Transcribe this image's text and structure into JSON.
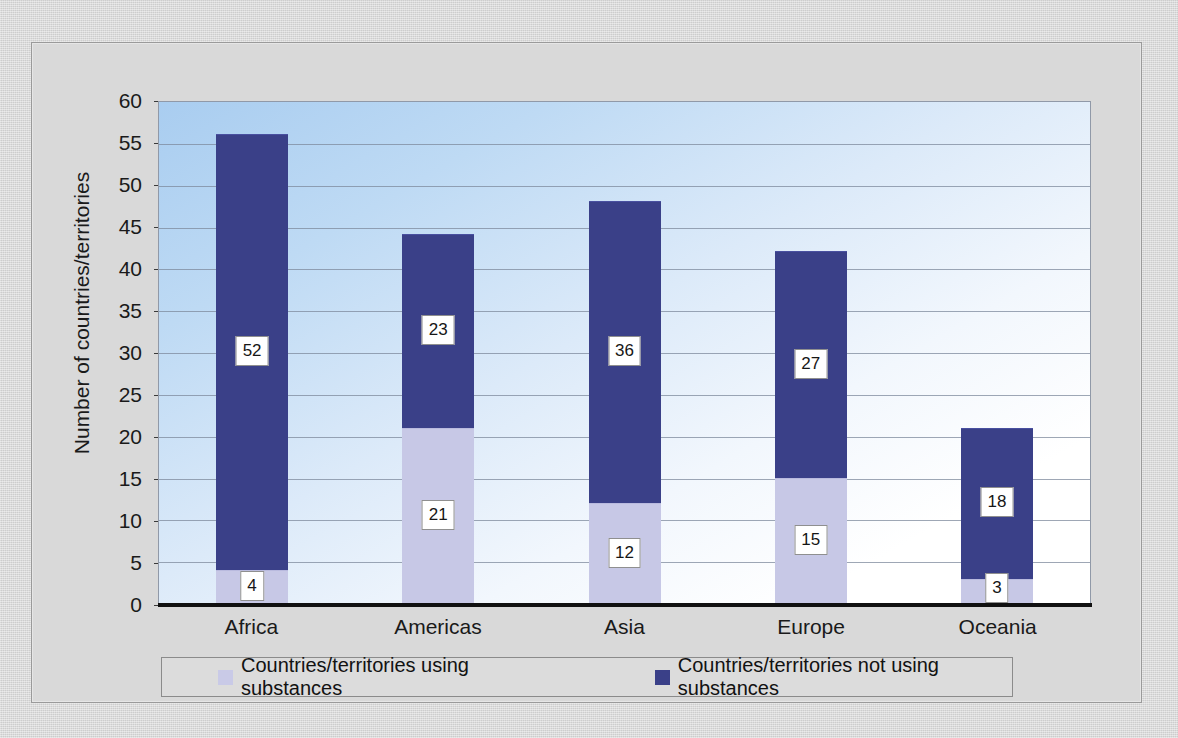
{
  "chart_data": {
    "type": "bar",
    "subtype": "stacked-column",
    "title": "",
    "xlabel": "",
    "ylabel": "Number of countries/territories",
    "ylim": [
      0,
      60
    ],
    "yticks": [
      0,
      5,
      10,
      15,
      20,
      25,
      30,
      35,
      40,
      45,
      50,
      55,
      60
    ],
    "grid": true,
    "legend_position": "bottom",
    "categories": [
      "Africa",
      "Americas",
      "Asia",
      "Europe",
      "Oceania"
    ],
    "series": [
      {
        "name": "Countries/territories using substances",
        "color": "#c7c8e6",
        "values": [
          4,
          21,
          12,
          15,
          3
        ]
      },
      {
        "name": "Countries/territories not using substances",
        "color": "#3a4088",
        "values": [
          52,
          23,
          36,
          27,
          18
        ]
      }
    ],
    "totals": [
      56,
      44,
      48,
      42,
      21
    ],
    "data_labels": {
      "Africa": {
        "using": "4",
        "not_using": "52"
      },
      "Americas": {
        "using": "21",
        "not_using": "23"
      },
      "Asia": {
        "using": "12",
        "not_using": "36"
      },
      "Europe": {
        "using": "15",
        "not_using": "27"
      },
      "Oceania": {
        "using": "3",
        "not_using": "18"
      }
    }
  },
  "axis": {
    "y_label": "Number of countries/territories",
    "y_tick_labels": [
      "60",
      "55",
      "50",
      "45",
      "40",
      "35",
      "30",
      "25",
      "20",
      "15",
      "10",
      "5",
      "0"
    ],
    "x_tick_labels": [
      "Africa",
      "Americas",
      "Asia",
      "Europe",
      "Oceania"
    ]
  },
  "legend": {
    "items": [
      {
        "label": "Countries/territories using substances",
        "color": "#c7c8e6"
      },
      {
        "label": "Countries/territories not using substances",
        "color": "#3a4088"
      }
    ]
  },
  "colors": {
    "series_light": "#c7c8e6",
    "series_dark": "#3a4088",
    "plot_background_top": "#a9cdf0",
    "plot_background_bottom": "#ffffff",
    "gridline": "#7e8a9c",
    "page_background": "#d4d4d4"
  }
}
